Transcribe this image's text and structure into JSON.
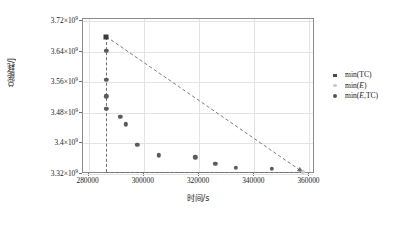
{
  "chart_data": {
    "type": "scatter",
    "title": "",
    "xlabel": "时间/s",
    "ylabel": "总能耗/J",
    "xlim": [
      278000,
      362000
    ],
    "ylim": [
      3320000000,
      3726000000
    ],
    "xticks": [
      280000,
      300000,
      320000,
      340000,
      360000
    ],
    "xticklabels": [
      "280000",
      "300000",
      "320000",
      "340000",
      "360000"
    ],
    "yticks": [
      3320000000,
      3400000000,
      3480000000,
      3560000000,
      3640000000,
      3720000000
    ],
    "yticklabels": [
      "3.32×10",
      "3.4×10",
      "3.48×10",
      "3.56×10",
      "3.64×10",
      "3.72×10"
    ],
    "yexponent": "9",
    "grid": true,
    "legend_position": "right-outside",
    "series": [
      {
        "name": "min(TC)",
        "marker": "square",
        "color": "#3b3b3b",
        "points": [
          {
            "x": 286400,
            "y": 3680000000
          }
        ]
      },
      {
        "name": "min(E)",
        "marker": "star",
        "color": "#c9c9c9",
        "points": [
          {
            "x": 357600,
            "y": 3325000000
          }
        ]
      },
      {
        "name": "min(E,TC)",
        "marker": "circle",
        "color": "#5b5b5b",
        "points": [
          {
            "x": 286400,
            "y": 3642000000
          },
          {
            "x": 286400,
            "y": 3566000000
          },
          {
            "x": 286400,
            "y": 3524000000
          },
          {
            "x": 286400,
            "y": 3491000000
          },
          {
            "x": 291500,
            "y": 3470000000
          },
          {
            "x": 293400,
            "y": 3450000000
          },
          {
            "x": 297600,
            "y": 3397000000
          },
          {
            "x": 305500,
            "y": 3369000000
          },
          {
            "x": 318600,
            "y": 3364000000
          },
          {
            "x": 325900,
            "y": 3346000000
          },
          {
            "x": 333300,
            "y": 3337000000
          },
          {
            "x": 346300,
            "y": 3334000000
          }
        ]
      }
    ],
    "annotations": {
      "vertical_dashed_x": 286400,
      "horizontal_dashed_y": 3325000000,
      "diagonal_from": {
        "x": 286400,
        "y": 3680000000
      },
      "diagonal_to": {
        "x": 357600,
        "y": 3325000000
      },
      "arrowhead": "bottom-right"
    }
  },
  "legend": {
    "items": [
      {
        "label_prefix": "min(",
        "label_italic": "",
        "label_suffix": "TC)",
        "marker": "square"
      },
      {
        "label_prefix": "min(",
        "label_italic": "E",
        "label_suffix": ")",
        "marker": "star"
      },
      {
        "label_prefix": "min(",
        "label_italic": "E",
        "label_suffix": ",TC)",
        "marker": "circle"
      }
    ]
  }
}
